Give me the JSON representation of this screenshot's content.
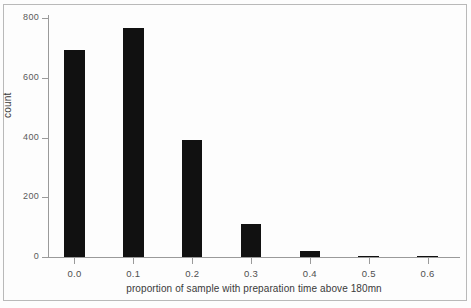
{
  "chart_data": {
    "type": "bar",
    "title": "",
    "subtitle": "",
    "xlabel": "proportion of sample with preparation time above 180mn",
    "ylabel": "count",
    "categories": [
      "0.0",
      "0.1",
      "0.2",
      "0.3",
      "0.4",
      "0.5",
      "0.6"
    ],
    "x": [
      0.0,
      0.1,
      0.2,
      0.3,
      0.4,
      0.5,
      0.6
    ],
    "values": [
      693,
      766,
      393,
      112,
      21,
      4,
      3
    ],
    "xlim": [
      -0.045,
      0.655
    ],
    "ylim": [
      0,
      800
    ],
    "x_ticks": [
      "0.0",
      "0.1",
      "0.2",
      "0.3",
      "0.4",
      "0.5",
      "0.6"
    ],
    "y_ticks": [
      "0",
      "200",
      "400",
      "600",
      "800"
    ],
    "y_tick_values": [
      0,
      200,
      400,
      600,
      800
    ],
    "grid": false,
    "legend": null,
    "bar_color": "#111111",
    "axis_color": "#9a9a9a",
    "bar_width": 0.035,
    "annotations": []
  },
  "figure": {
    "frame_color": "#b9b9b9",
    "background": "#fdfdfd"
  }
}
